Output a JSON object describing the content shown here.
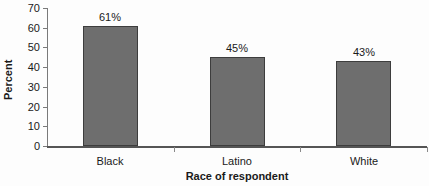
{
  "chart_data": {
    "type": "bar",
    "title": "",
    "xlabel": "Race of respondent",
    "ylabel": "Percent",
    "categories": [
      "Black",
      "Latino",
      "White"
    ],
    "values": [
      61,
      45,
      43
    ],
    "value_labels": [
      "61%",
      "45%",
      "43%"
    ],
    "ylim": [
      0,
      70
    ],
    "ytick_labels": [
      "0",
      "10",
      "20",
      "30",
      "40",
      "50",
      "60",
      "70"
    ],
    "ytick_values": [
      0,
      10,
      20,
      30,
      40,
      50,
      60,
      70
    ],
    "grid": false,
    "legend": "none",
    "bar_color": "#6e6e6e",
    "bar_border_color": "#3d3d3d",
    "axis_color": "#555555",
    "text_color": "#1a1a1a",
    "background_color": "#fdfdfd"
  }
}
